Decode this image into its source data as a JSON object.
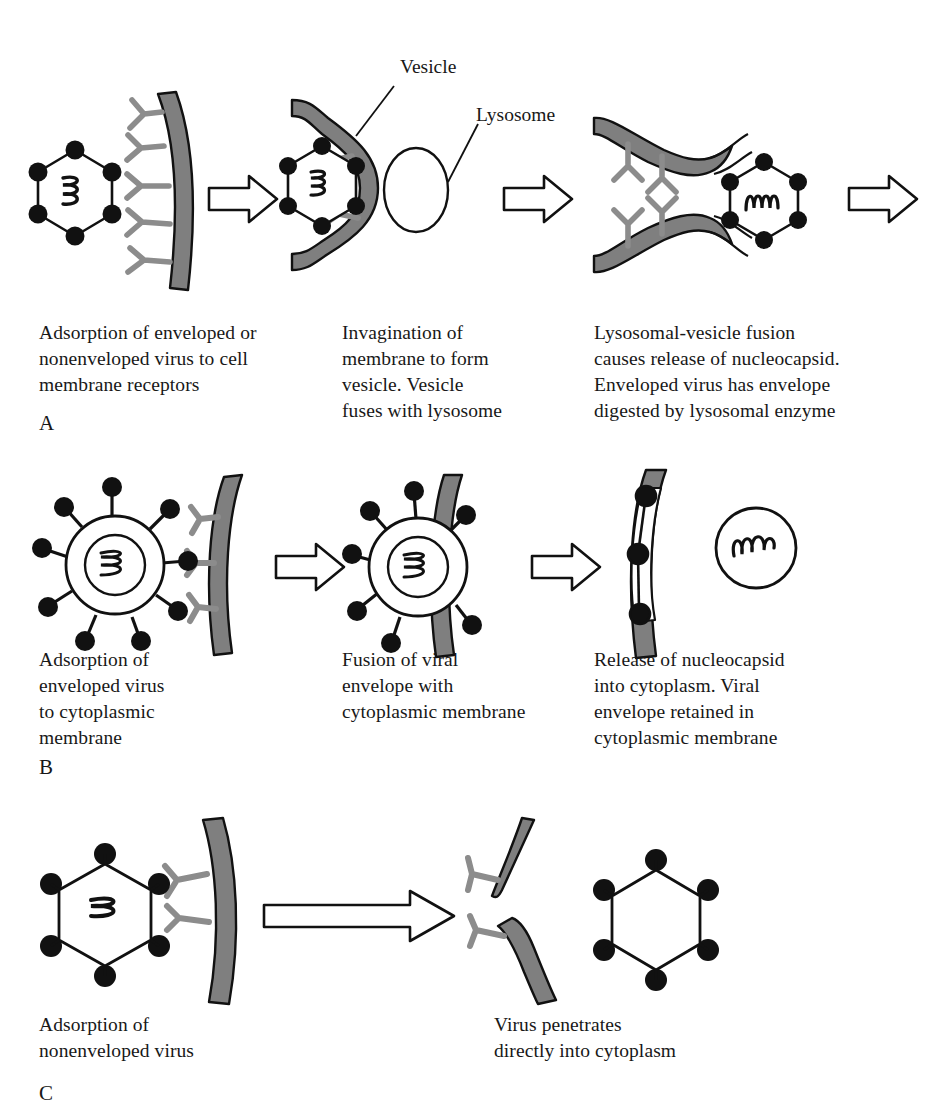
{
  "figure": {
    "title_colors": {
      "membrane_gray": "#7f7f7f",
      "receptor_gray": "#8c8c8c",
      "ink": "#1a1a1a",
      "background": "#ffffff"
    }
  },
  "panels": [
    {
      "letter": "A",
      "callouts": [
        {
          "name": "vesicle",
          "text": "Vesicle"
        },
        {
          "name": "lysosome",
          "text": "Lysosome"
        }
      ],
      "steps": [
        {
          "caption": "Adsorption of enveloped or\nnonenveloped virus to cell\nmembrane receptors",
          "virus": "hexagonal-capsid",
          "arrow_after": true
        },
        {
          "caption": "Invagination of\nmembrane to form\nvesicle. Vesicle\nfuses with lysosome",
          "virus": "hexagonal-capsid-in-vesicle",
          "arrow_after": true
        },
        {
          "caption": "Lysosomal-vesicle fusion\ncauses release of nucleocapsid.\nEnveloped virus has envelope\ndigested by lysosomal enzyme",
          "virus": "hexagonal-capsid-released",
          "arrow_after": true
        }
      ]
    },
    {
      "letter": "B",
      "callouts": [],
      "steps": [
        {
          "caption": "Adsorption of\nenveloped virus\nto cytoplasmic\nmembrane",
          "virus": "enveloped-spiked-virus",
          "arrow_after": true
        },
        {
          "caption": "Fusion of viral\nenvelope with\ncytoplasmic membrane",
          "virus": "enveloped-virus-fusing",
          "arrow_after": true
        },
        {
          "caption": "Release of nucleocapsid\ninto cytoplasm. Viral\nenvelope retained in\ncytoplasmic membrane",
          "virus": "free-nucleocapsid",
          "arrow_after": false
        }
      ]
    },
    {
      "letter": "C",
      "callouts": [],
      "steps": [
        {
          "caption": "Adsorption of\nnonenveloped virus",
          "virus": "hexagonal-capsid",
          "arrow_after": true
        },
        {
          "caption": "Virus penetrates\ndirectly into cytoplasm",
          "virus": "hexagonal-capsid-penetrated",
          "arrow_after": false
        }
      ]
    }
  ]
}
